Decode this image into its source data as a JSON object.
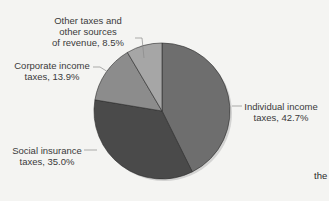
{
  "chart_data": {
    "type": "pie",
    "title": "",
    "start_angle_deg": 0,
    "direction": "clockwise",
    "slices": [
      {
        "label": "Individual income taxes",
        "value": 42.7,
        "color": "#6e6e6e"
      },
      {
        "label": "Social insurance taxes",
        "value": 35.0,
        "color": "#4a4a4a"
      },
      {
        "label": "Corporate income taxes",
        "value": 13.9,
        "color": "#8c8c8c"
      },
      {
        "label": "Other taxes and other sources of revenue",
        "value": 8.5,
        "color": "#a6a6a6"
      }
    ],
    "legend": "none (callout labels)"
  },
  "labels": {
    "individual": {
      "line1": "Individual income",
      "line2": "taxes, 42.7%"
    },
    "social": {
      "line1": "Social insurance",
      "line2": "taxes, 35.0%"
    },
    "corporate": {
      "line1": "Corporate income",
      "line2": "taxes, 13.9%"
    },
    "other": {
      "line1": "Other taxes and",
      "line2": "other sources",
      "line3": "of revenue, 8.5%"
    }
  },
  "background_text": {
    "fragment": "the"
  }
}
